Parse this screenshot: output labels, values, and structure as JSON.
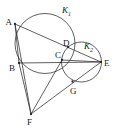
{
  "figure": {
    "type": "geometry-diagram",
    "width": 117,
    "height": 128,
    "background_color": "#ffffff",
    "stroke_color": "#2b2b2b",
    "label_color": "#1a1a1a"
  },
  "points": [
    {
      "id": "A",
      "label": "A",
      "x": 15.0,
      "y": 24.0,
      "label_x": 5.5,
      "label_y": 24.5,
      "on_circles": [
        "K1"
      ]
    },
    {
      "id": "B",
      "label": "B",
      "x": 19.0,
      "y": 63.0,
      "label_x": 9.0,
      "label_y": 71.0,
      "on_circles": [
        "K1"
      ]
    },
    {
      "id": "C",
      "label": "C",
      "x": 62.0,
      "y": 60.0,
      "label_x": 55.0,
      "label_y": 58.0,
      "on_circles": [
        "K1",
        "K2"
      ]
    },
    {
      "id": "D",
      "label": "D",
      "x": 68.0,
      "y": 47.0,
      "label_x": 63.0,
      "label_y": 45.5,
      "on_circles": [
        "K1",
        "K2"
      ]
    },
    {
      "id": "E",
      "label": "E",
      "x": 101.0,
      "y": 62.0,
      "label_x": 104.0,
      "label_y": 66.0,
      "on_circles": [
        "K2"
      ]
    },
    {
      "id": "F",
      "label": "F",
      "x": 31.0,
      "y": 114.0,
      "label_x": 27.0,
      "label_y": 125.0,
      "on_circles": []
    },
    {
      "id": "G",
      "label": "G",
      "x": 72.5,
      "y": 81.5,
      "label_x": 70.0,
      "label_y": 94.0,
      "on_circles": [
        "K2"
      ]
    }
  ],
  "circles": [
    {
      "id": "K1",
      "label": "K",
      "subscript": "1",
      "cx": 45.0,
      "cy": 43.5,
      "r": 30.0,
      "label_x": 62.0,
      "label_y": 13.0,
      "passes_through": [
        "A",
        "B",
        "C",
        "D"
      ]
    },
    {
      "id": "K2",
      "label": "K",
      "subscript": "2",
      "cx": 81.5,
      "cy": 62.0,
      "r": 20.0,
      "label_x": 84.0,
      "label_y": 49.0,
      "passes_through": [
        "C",
        "D",
        "E",
        "G"
      ]
    }
  ],
  "segments": [
    {
      "id": "AB",
      "from": "A",
      "to": "B",
      "label": "A to B"
    },
    {
      "id": "AE",
      "from": "A",
      "to": "E",
      "label": "A to E through D"
    },
    {
      "id": "BE",
      "from": "B",
      "to": "E",
      "label": "B to E through C"
    },
    {
      "id": "AF",
      "from": "A",
      "to": "F",
      "label": "A to F"
    },
    {
      "id": "BF",
      "from": "B",
      "to": "F",
      "label": "B to F"
    },
    {
      "id": "CF",
      "from": "C",
      "to": "F",
      "label": "C to F"
    },
    {
      "id": "FE",
      "from": "F",
      "to": "E",
      "label": "F to E through G"
    },
    {
      "id": "CE",
      "from": "C",
      "to": "E",
      "label": "C to E"
    }
  ]
}
